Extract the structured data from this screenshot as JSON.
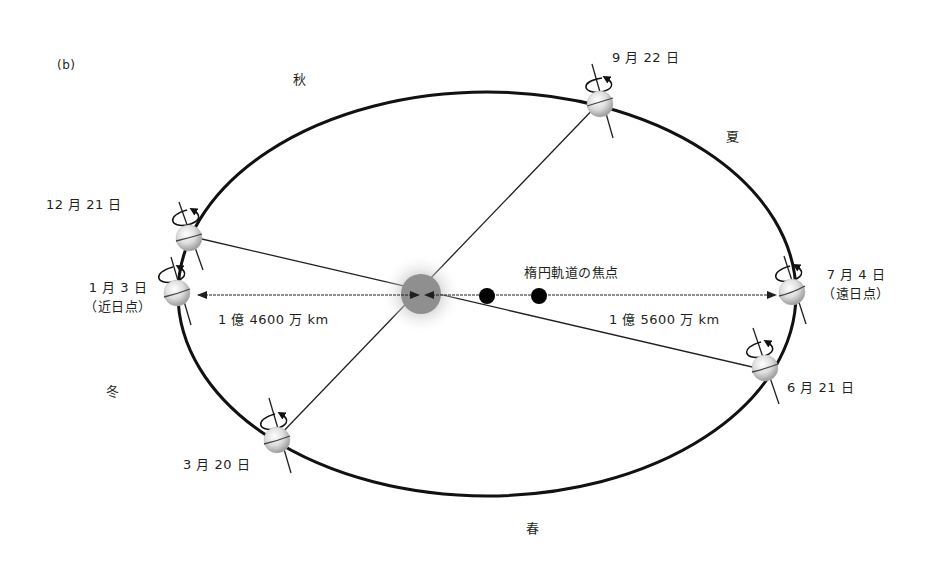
{
  "panel_label": "(b)",
  "seasons": {
    "autumn": "秋",
    "summer": "夏",
    "winter": "冬",
    "spring": "春"
  },
  "orbit_points": [
    {
      "id": "sep22",
      "date": "9 月 22 日",
      "note": ""
    },
    {
      "id": "dec21",
      "date": "12 月 21 日",
      "note": ""
    },
    {
      "id": "jan3",
      "date": "1 月 3 日",
      "note": "（近日点）"
    },
    {
      "id": "jul4",
      "date": "7 月 4 日",
      "note": "（遠日点）"
    },
    {
      "id": "jun21",
      "date": "6 月 21 日",
      "note": ""
    },
    {
      "id": "mar20",
      "date": "3 月 20 日",
      "note": ""
    }
  ],
  "focus_label": "楕円軌道の焦点",
  "distances": {
    "perihelion": "1 億 4600 万 km",
    "aphelion": "1 億 5600 万 km"
  },
  "colors": {
    "orbit": "#111111",
    "line": "#231f20",
    "sun_core": "#8f8f8f",
    "sun_glow": "#c8c8c8",
    "earth_light": "#f4f4f4",
    "earth_dark": "#a9a9a9",
    "focus_dot": "#000000"
  }
}
